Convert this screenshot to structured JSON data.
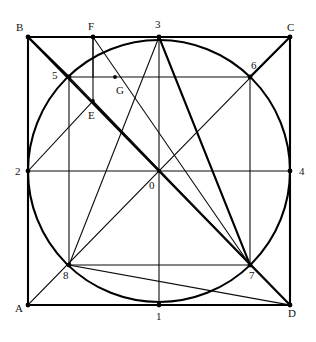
{
  "figure": {
    "type": "geometric-construction-diagram",
    "canvas": {
      "width": 316,
      "height": 342
    },
    "colors": {
      "background": "#ffffff",
      "stroke": "#0b0b0b",
      "stroke_heavy": "#000000",
      "label": "#141414"
    },
    "square": {
      "name": "ABCD",
      "left": 28,
      "top": 37,
      "right": 290,
      "bottom": 305
    },
    "circle": {
      "center_x": 159,
      "center_y": 171,
      "radius": 131
    },
    "points": [
      {
        "id": "A",
        "label": "A",
        "x": 28,
        "y": 305,
        "label_x": 15,
        "label_y": 303,
        "kind": "square-corner"
      },
      {
        "id": "B",
        "label": "B",
        "x": 28,
        "y": 37,
        "label_x": 16,
        "label_y": 22,
        "kind": "square-corner"
      },
      {
        "id": "C",
        "label": "C",
        "x": 290,
        "y": 37,
        "label_x": 287,
        "label_y": 22,
        "kind": "square-corner"
      },
      {
        "id": "D",
        "label": "D",
        "x": 290,
        "y": 305,
        "label_x": 288,
        "label_y": 308,
        "kind": "square-corner"
      },
      {
        "id": "P1",
        "label": "1",
        "x": 159,
        "y": 305,
        "label_x": 156,
        "label_y": 311,
        "kind": "edge-midpoint"
      },
      {
        "id": "P2",
        "label": "2",
        "x": 28,
        "y": 171,
        "label_x": 15,
        "label_y": 166,
        "kind": "edge-midpoint"
      },
      {
        "id": "P3",
        "label": "3",
        "x": 159,
        "y": 37,
        "label_x": 155,
        "label_y": 19,
        "kind": "edge-midpoint"
      },
      {
        "id": "P4",
        "label": "4",
        "x": 290,
        "y": 171,
        "label_x": 299,
        "label_y": 166,
        "kind": "edge-midpoint"
      },
      {
        "id": "P5",
        "label": "5",
        "x": 69,
        "y": 77,
        "label_x": 52,
        "label_y": 70,
        "kind": "circle-diagonal"
      },
      {
        "id": "P6",
        "label": "6",
        "x": 250,
        "y": 77,
        "label_x": 251,
        "label_y": 60,
        "kind": "circle-diagonal"
      },
      {
        "id": "P7",
        "label": "7",
        "x": 250,
        "y": 265,
        "label_x": 249,
        "label_y": 270,
        "kind": "circle-diagonal"
      },
      {
        "id": "P8",
        "label": "8",
        "x": 69,
        "y": 265,
        "label_x": 63,
        "label_y": 270,
        "kind": "circle-diagonal"
      },
      {
        "id": "O",
        "label": "0",
        "x": 159,
        "y": 171,
        "label_x": 149,
        "label_y": 180,
        "kind": "center"
      },
      {
        "id": "E",
        "label": "E",
        "x": 93,
        "y": 101,
        "label_x": 88,
        "label_y": 110,
        "kind": "construction"
      },
      {
        "id": "F",
        "label": "F",
        "x": 93,
        "y": 37,
        "label_x": 88,
        "label_y": 21,
        "kind": "top-edge-construction"
      },
      {
        "id": "G",
        "label": "G",
        "x": 115,
        "y": 77,
        "label_x": 116,
        "label_y": 85,
        "kind": "construction"
      }
    ],
    "segments": [
      {
        "name": "outer-square-top",
        "x1": 28,
        "y1": 37,
        "x2": 290,
        "y2": 37,
        "weight": "heavy"
      },
      {
        "name": "outer-square-right",
        "x1": 290,
        "y1": 37,
        "x2": 290,
        "y2": 305,
        "weight": "heavy"
      },
      {
        "name": "outer-square-bottom",
        "x1": 290,
        "y1": 305,
        "x2": 28,
        "y2": 305,
        "weight": "heavy"
      },
      {
        "name": "outer-square-left",
        "x1": 28,
        "y1": 305,
        "x2": 28,
        "y2": 37,
        "weight": "heavy"
      },
      {
        "name": "diagonal-B-to-D",
        "x1": 28,
        "y1": 37,
        "x2": 290,
        "y2": 305,
        "weight": "heavy"
      },
      {
        "name": "diagonal-A-to-C",
        "x1": 28,
        "y1": 305,
        "x2": 290,
        "y2": 37,
        "weight": "light"
      },
      {
        "name": "median-vertical-3-1",
        "x1": 159,
        "y1": 37,
        "x2": 159,
        "y2": 305,
        "weight": "light"
      },
      {
        "name": "median-horizontal-2-4",
        "x1": 28,
        "y1": 171,
        "x2": 290,
        "y2": 171,
        "weight": "light"
      },
      {
        "name": "inner-square-top-5-6",
        "x1": 69,
        "y1": 77,
        "x2": 250,
        "y2": 77,
        "weight": "light"
      },
      {
        "name": "inner-square-right-6-7",
        "x1": 250,
        "y1": 77,
        "x2": 250,
        "y2": 265,
        "weight": "light"
      },
      {
        "name": "inner-square-bottom-7-8",
        "x1": 250,
        "y1": 265,
        "x2": 69,
        "y2": 265,
        "weight": "light"
      },
      {
        "name": "inner-square-left-8-5",
        "x1": 69,
        "y1": 265,
        "x2": 69,
        "y2": 77,
        "weight": "light"
      },
      {
        "name": "chord-3-to-8",
        "x1": 159,
        "y1": 37,
        "x2": 69,
        "y2": 265,
        "weight": "light"
      },
      {
        "name": "chord-3-to-7",
        "x1": 159,
        "y1": 37,
        "x2": 250,
        "y2": 265,
        "weight": "heavy"
      },
      {
        "name": "chord-2-to-E",
        "x1": 28,
        "y1": 171,
        "x2": 93,
        "y2": 101,
        "weight": "light"
      },
      {
        "name": "chord-5-to-D",
        "x1": 69,
        "y1": 77,
        "x2": 290,
        "y2": 305,
        "weight": "light"
      },
      {
        "name": "line-F-to-E",
        "x1": 93,
        "y1": 37,
        "x2": 93,
        "y2": 101,
        "weight": "light"
      },
      {
        "name": "line-F-to-7",
        "x1": 93,
        "y1": 37,
        "x2": 250,
        "y2": 265,
        "weight": "light"
      },
      {
        "name": "line-E-to-7",
        "x1": 93,
        "y1": 101,
        "x2": 250,
        "y2": 265,
        "weight": "light"
      },
      {
        "name": "line-7-to-D",
        "x1": 250,
        "y1": 265,
        "x2": 290,
        "y2": 305,
        "weight": "light"
      },
      {
        "name": "line-8-to-D",
        "x1": 69,
        "y1": 265,
        "x2": 290,
        "y2": 305,
        "weight": "light"
      },
      {
        "name": "line-5-to-B",
        "x1": 69,
        "y1": 77,
        "x2": 28,
        "y2": 37,
        "weight": "heavy"
      },
      {
        "name": "line-6-to-C",
        "x1": 250,
        "y1": 77,
        "x2": 290,
        "y2": 37,
        "weight": "heavy"
      },
      {
        "name": "vertical-F-top",
        "x1": 93,
        "y1": 37,
        "x2": 93,
        "y2": 77,
        "weight": "light"
      }
    ]
  }
}
